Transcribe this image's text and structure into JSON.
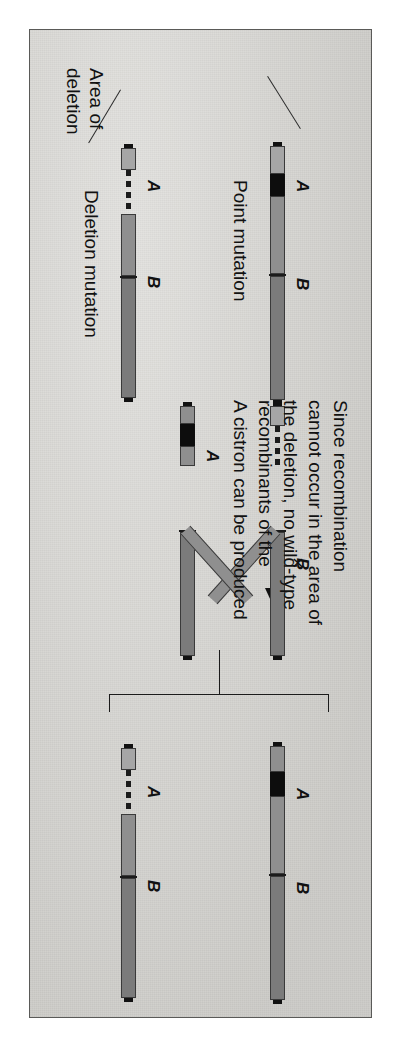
{
  "figure": {
    "domain_note": "genetics diagram: deletion mapping / recombination",
    "background_color": "#d8d7d3",
    "frame_color": "#5a5a58",
    "orientation": "rotated-90-sideways"
  },
  "labels": {
    "cistron_a": "A",
    "cistron_b": "B",
    "point_mutation": "Point mutation",
    "deletion_mutation": "Deletion mutation",
    "area_of_deletion_line1": "Area of",
    "area_of_deletion_line2": "deletion",
    "cross_symbol": "×"
  },
  "caption": {
    "line1": "Since recombination",
    "line2": "cannot occur in the area of",
    "line3": "the deletion, no wild-type",
    "line4": "recombinants of the",
    "line5": "A cistron can be produced"
  },
  "parents": {
    "point_mutant": {
      "name": "Point mutation chromosome",
      "cistron_a": "A",
      "cistron_b": "B",
      "mutation_type": "point",
      "mutation_color": "#0d0d0d"
    },
    "deletion_mutant": {
      "name": "Deletion mutation chromosome",
      "cistron_a": "A",
      "cistron_b": "B",
      "mutation_type": "deletion",
      "deletion_style": "dashed-gap"
    }
  },
  "crossover": {
    "name": "recombination crossover",
    "strand_top_label": "B",
    "strand_bottom_label": "A",
    "strand_color": "#8f8f8f"
  },
  "products": {
    "upper": {
      "name": "recombinant chromosome with point mutation",
      "cistron_a": "A",
      "cistron_b": "B"
    },
    "lower": {
      "name": "recombinant chromosome with deletion",
      "cistron_a": "A",
      "cistron_b": "B"
    }
  },
  "colors": {
    "segment_dark": "#7b7b7b",
    "segment_mid": "#8f8f8f",
    "segment_light": "#a6a6a6",
    "mutation_black": "#0d0d0d",
    "outline": "#3a3a3a"
  }
}
